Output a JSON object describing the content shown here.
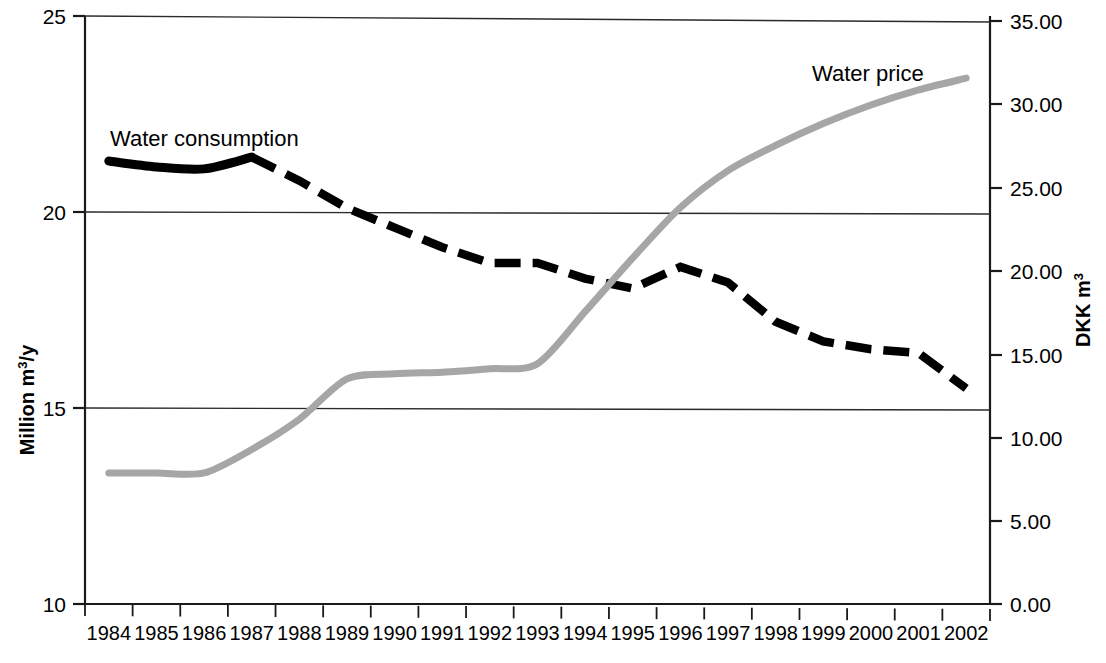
{
  "chart_data": {
    "type": "line",
    "title": "",
    "xlabel": "",
    "ylabel": "Million m3/y",
    "y2label": "DKK m3",
    "grid": true,
    "legend": "inline-labels",
    "categories": [
      "1984",
      "1985",
      "1986",
      "1987",
      "1988",
      "1989",
      "1990",
      "1991",
      "1992",
      "1993",
      "1994",
      "1995",
      "1996",
      "1997",
      "1998",
      "1999",
      "2000",
      "2001",
      "2002"
    ],
    "xlim": [
      "1984",
      "2002"
    ],
    "ylim": [
      10,
      25
    ],
    "yticks": [
      "10",
      "15",
      "20",
      "25"
    ],
    "y2lim": [
      0.0,
      35.0
    ],
    "y2ticks": [
      "0.00",
      "5.00",
      "10.00",
      "15.00",
      "20.00",
      "25.00",
      "30.00",
      "35.00"
    ],
    "series": [
      {
        "name": "Water consumption",
        "axis": "left",
        "color": "#000000",
        "style": "solid-then-dashed",
        "unit": "Million m3/y",
        "values": [
          21.3,
          21.15,
          21.1,
          21.4,
          20.8,
          20.1,
          19.6,
          19.1,
          18.7,
          18.7,
          18.3,
          18.05,
          18.6,
          18.2,
          17.2,
          16.7,
          16.5,
          16.4,
          15.5
        ]
      },
      {
        "name": "Water price",
        "axis": "right",
        "color": "#a6a6a6",
        "style": "solid",
        "unit": "DKK m3",
        "values": [
          7.8,
          7.8,
          7.8,
          9.2,
          11.0,
          13.4,
          13.7,
          13.8,
          14.0,
          14.3,
          17.4,
          20.6,
          23.6,
          25.8,
          27.3,
          28.6,
          29.7,
          30.6,
          31.3
        ]
      }
    ],
    "annotations": [
      {
        "text": "Water consumption",
        "x_year": "1986",
        "y_value": 22.3
      },
      {
        "text": "Water price",
        "x_year": "2000",
        "y2_value": 33.1
      }
    ]
  },
  "axes": {
    "left_title_parts": {
      "main": "Million m",
      "sup": "3",
      "tail": "/y"
    },
    "right_title_parts": {
      "main": "DKK m",
      "sup": "3"
    }
  }
}
